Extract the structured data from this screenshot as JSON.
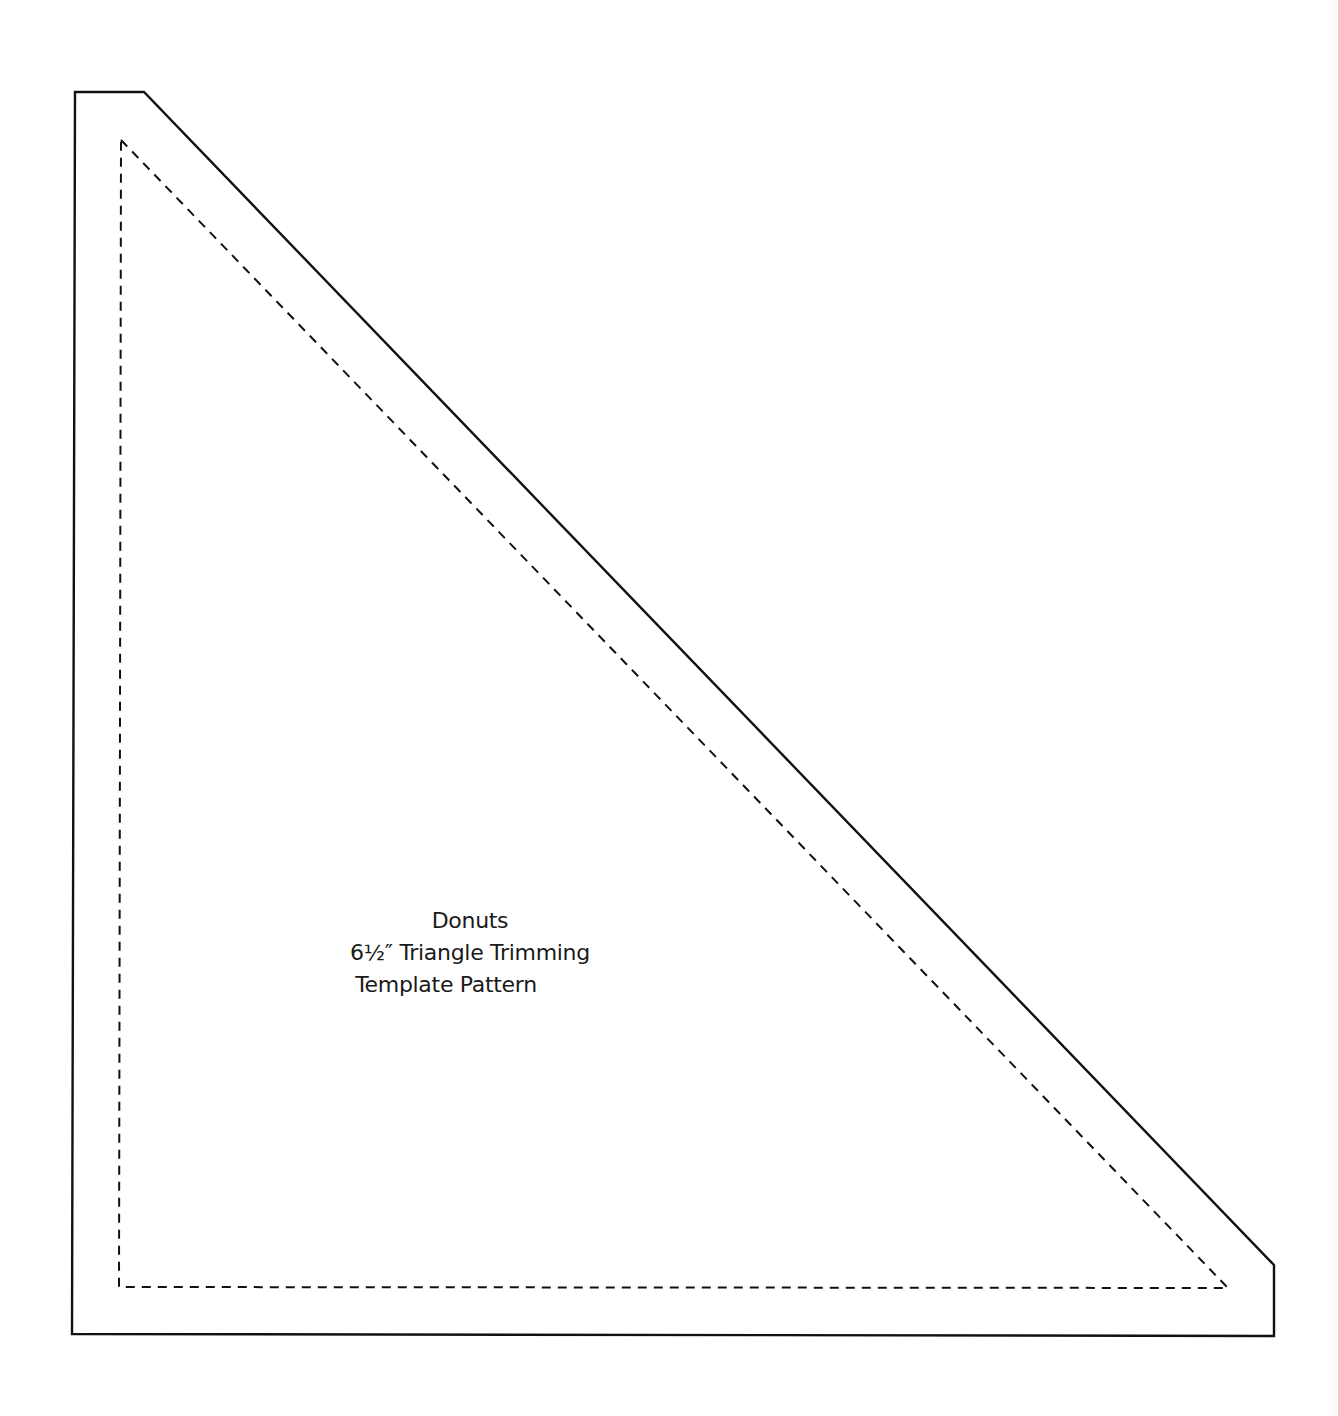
{
  "document": {
    "type": "quilting template pattern",
    "label": {
      "line1": "Donuts",
      "line2": "6½″ Triangle Trimming",
      "line3": "Template Pattern"
    },
    "outline": {
      "cut_line": {
        "style": "solid",
        "color": "#111111",
        "points": [
          [
            75,
            92
          ],
          [
            144,
            92
          ],
          [
            1274,
            1265
          ],
          [
            1274,
            1336
          ],
          [
            72,
            1334
          ]
        ]
      },
      "seam_line": {
        "style": "dashed",
        "color": "#111111",
        "points": [
          [
            121,
            140
          ],
          [
            1228,
            1288
          ],
          [
            119,
            1287
          ]
        ]
      }
    },
    "colors": {
      "background": "#ffffff",
      "line": "#111111",
      "text": "#1a1a1a"
    }
  }
}
